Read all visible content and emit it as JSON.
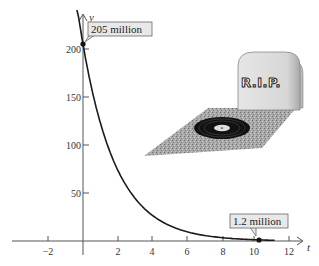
{
  "chart_data": {
    "type": "line",
    "title": "",
    "xlabel": "t",
    "ylabel": "y",
    "xlim": [
      -4.5,
      13
    ],
    "ylim": [
      0,
      210
    ],
    "x_ticks": [
      -2,
      2,
      4,
      6,
      8,
      10,
      12
    ],
    "x_tick_labels": [
      "−2",
      "2",
      "4",
      "6",
      "8",
      "10",
      "12"
    ],
    "y_ticks": [
      50,
      100,
      150,
      200
    ],
    "y_tick_labels": [
      "50",
      "100",
      "150",
      "200"
    ],
    "grid": false,
    "series": [
      {
        "name": "y = 205 e^{-0.51 t}",
        "x": [
          -0.4,
          0,
          1,
          2,
          3,
          4,
          5,
          6,
          7,
          8,
          9,
          10,
          11
        ],
        "y": [
          251,
          205,
          123.2,
          74.0,
          44.5,
          26.7,
          16.1,
          9.6,
          5.8,
          3.5,
          2.1,
          1.2,
          0.7
        ],
        "color": "#1a1a1a"
      }
    ],
    "points": [
      {
        "x": 0,
        "y": 205,
        "label": "205 million"
      },
      {
        "x": 10,
        "y": 1.2,
        "label": "1.2 million"
      }
    ],
    "annotations": [
      {
        "type": "callout",
        "text": "205 million",
        "at": [
          0,
          205
        ]
      },
      {
        "type": "callout",
        "text": "1.2 million",
        "at": [
          10,
          1.2
        ]
      },
      {
        "type": "illustration",
        "text": "R.I.P",
        "description": "tombstone with vinyl record on grave"
      }
    ]
  },
  "labels": {
    "y_axis": "y",
    "x_axis": "t",
    "callout_start": "205 million",
    "callout_end": "1.2 million",
    "tombstone": "R.I.P."
  },
  "colors": {
    "curve": "#1a1a1a",
    "axis": "#555555",
    "callout_bg": "#e8e8e8",
    "callout_border": "#666666",
    "stone": "#d9d9d9",
    "stone_shade": "#b3b3b3",
    "grave": "#9a9a9a",
    "record": "#111111"
  }
}
